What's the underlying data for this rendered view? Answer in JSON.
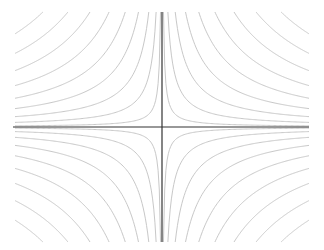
{
  "chart_data": {
    "type": "line",
    "subtype": "contour",
    "title": "",
    "xlabel": "",
    "ylabel": "",
    "function": "x*y",
    "xlim": [
      -1,
      1
    ],
    "ylim": [
      -1,
      1
    ],
    "levels": [
      0.01,
      0.04,
      0.09,
      0.16,
      0.25,
      0.36,
      0.49,
      0.64,
      0.81
    ],
    "quadrants": [
      "I",
      "II",
      "III",
      "IV"
    ],
    "grid": false,
    "legend": null,
    "axes_visible": true,
    "tick_labels": false,
    "colors": {
      "background": "#ffffff",
      "axis": "#333333",
      "contour": "#c8c8c8"
    },
    "layout": {
      "origin_px": [
        162,
        127
      ],
      "x_extent_px": [
        13,
        309
      ],
      "y_extent_px": [
        12,
        242
      ]
    }
  }
}
